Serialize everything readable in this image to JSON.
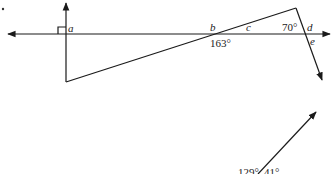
{
  "diagram": {
    "type": "geometry-angles",
    "stroke_color": "#1a1a1a",
    "background": "#ffffff",
    "points": {
      "a": "a",
      "b": "b",
      "c": "c",
      "d": "d",
      "e": "e"
    },
    "angles": {
      "at_b": "163°",
      "at_peak": "70°",
      "lower_left": "129°",
      "lower_right": "41°"
    },
    "markers": {
      "right_angle_at": "a"
    }
  }
}
